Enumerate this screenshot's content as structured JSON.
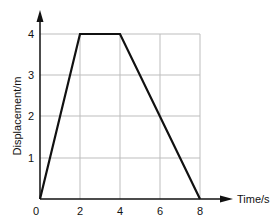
{
  "chart_data": {
    "type": "line",
    "title": "",
    "xlabel": "Time/s",
    "ylabel": "Displacement/m",
    "x_ticks": [
      "0",
      "2",
      "4",
      "6",
      "8"
    ],
    "y_ticks": [
      "1",
      "2",
      "3",
      "4"
    ],
    "xlim": [
      0,
      8
    ],
    "ylim": [
      0,
      4
    ],
    "grid": true,
    "legend": null,
    "series": [
      {
        "name": "displacement",
        "x": [
          0,
          2,
          4,
          8
        ],
        "y": [
          0,
          4,
          4,
          0
        ]
      }
    ]
  },
  "colors": {
    "line": "#111111",
    "axis": "#111111",
    "grid": "#bdbdbd"
  }
}
